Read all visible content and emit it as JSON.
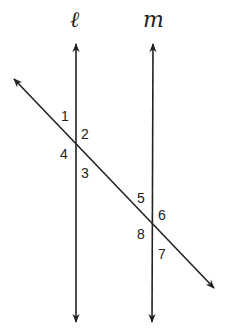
{
  "diagram": {
    "type": "parallel-lines-cut-by-transversal",
    "line_names": {
      "left": "ℓ",
      "right": "m"
    },
    "angle_labels": [
      "1",
      "2",
      "3",
      "4",
      "5",
      "6",
      "7",
      "8"
    ],
    "colors": {
      "stroke": "#222222",
      "background": "#ffffff"
    }
  }
}
